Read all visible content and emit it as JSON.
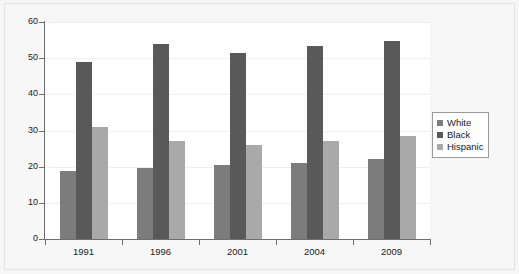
{
  "chart_data": {
    "type": "bar",
    "title": "",
    "xlabel": "",
    "ylabel": "",
    "categories": [
      "1991",
      "1996",
      "2001",
      "2004",
      "2009"
    ],
    "series": [
      {
        "name": "White",
        "color": "#7c7c7c",
        "values": [
          18.7,
          19.6,
          20.6,
          21.1,
          22.0
        ]
      },
      {
        "name": "Black",
        "color": "#595959",
        "values": [
          49.0,
          54.0,
          51.3,
          53.5,
          54.8
        ]
      },
      {
        "name": "Hispanic",
        "color": "#a9a9a9",
        "values": [
          31.0,
          27.1,
          26.0,
          27.1,
          28.6
        ]
      }
    ],
    "ylim": [
      0,
      60
    ],
    "yticks": [
      0,
      10,
      20,
      30,
      40,
      50,
      60
    ],
    "ytick_labels": [
      "0",
      "10",
      "20",
      "30",
      "40",
      "50",
      "60"
    ],
    "grid": true,
    "legend_position": "right"
  },
  "legend": {
    "items": [
      {
        "label": "White"
      },
      {
        "label": "Black"
      },
      {
        "label": "Hispanic"
      }
    ]
  }
}
